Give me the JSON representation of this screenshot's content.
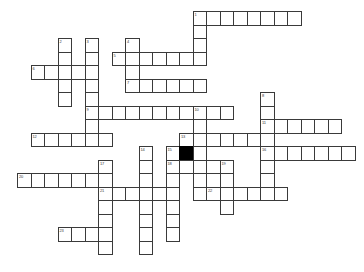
{
  "puzzle": {
    "title": "Crossword Puzzle Grid",
    "grid": {
      "cell_size": 13.5,
      "origin_x": 17,
      "origin_y": 11,
      "columns": 25,
      "rows": 19,
      "line_color": "#3a3a3a",
      "cell_color": "#ffffff",
      "block_color": "#000000",
      "background_color": "#ffffff"
    },
    "entries": [
      {
        "number": "1",
        "direction": "across",
        "row": 0,
        "col": 13,
        "length": 8
      },
      {
        "number": "1",
        "direction": "down",
        "row": 0,
        "col": 13,
        "length": 4
      },
      {
        "number": "2",
        "direction": "down",
        "row": 2,
        "col": 3,
        "length": 5
      },
      {
        "number": "3",
        "direction": "down",
        "row": 2,
        "col": 5,
        "length": 8
      },
      {
        "number": "4",
        "direction": "down",
        "row": 2,
        "col": 8,
        "length": 5
      },
      {
        "number": "5",
        "direction": "across",
        "row": 3,
        "col": 7,
        "length": 7
      },
      {
        "number": "6",
        "direction": "across",
        "row": 4,
        "col": 1,
        "length": 5
      },
      {
        "number": "7",
        "direction": "across",
        "row": 5,
        "col": 8,
        "length": 6
      },
      {
        "number": "8",
        "direction": "down",
        "row": 6,
        "col": 18,
        "length": 7
      },
      {
        "number": "9",
        "direction": "across",
        "row": 7,
        "col": 5,
        "length": 11
      },
      {
        "number": "10",
        "direction": "down",
        "row": 7,
        "col": 13,
        "length": 6
      },
      {
        "number": "11",
        "direction": "across",
        "row": 8,
        "col": 18,
        "length": 6
      },
      {
        "number": "12",
        "direction": "across",
        "row": 9,
        "col": 1,
        "length": 6
      },
      {
        "number": "13",
        "direction": "across",
        "row": 9,
        "col": 12,
        "length": 6
      },
      {
        "number": "14",
        "direction": "down",
        "row": 10,
        "col": 9,
        "length": 8
      },
      {
        "number": "15",
        "direction": "down",
        "row": 10,
        "col": 11,
        "length": 7
      },
      {
        "number": "16",
        "direction": "across",
        "row": 10,
        "col": 18,
        "length": 7
      },
      {
        "number": "17",
        "direction": "down",
        "row": 11,
        "col": 6,
        "length": 8
      },
      {
        "number": "18",
        "direction": "across",
        "row": 11,
        "col": 11,
        "length": 5
      },
      {
        "number": "19",
        "direction": "down",
        "row": 11,
        "col": 15,
        "length": 4
      },
      {
        "number": "20",
        "direction": "across",
        "row": 12,
        "col": 0,
        "length": 7
      },
      {
        "number": "21",
        "direction": "across",
        "row": 13,
        "col": 6,
        "length": 6
      },
      {
        "number": "22",
        "direction": "across",
        "row": 13,
        "col": 14,
        "length": 6
      },
      {
        "number": "23",
        "direction": "across",
        "row": 16,
        "col": 3,
        "length": 4
      }
    ],
    "cells": [
      {
        "col": 13,
        "row": 0,
        "number": "1"
      },
      {
        "col": 14,
        "row": 0
      },
      {
        "col": 15,
        "row": 0
      },
      {
        "col": 16,
        "row": 0
      },
      {
        "col": 17,
        "row": 0
      },
      {
        "col": 18,
        "row": 0
      },
      {
        "col": 19,
        "row": 0
      },
      {
        "col": 20,
        "row": 0
      },
      {
        "col": 13,
        "row": 1
      },
      {
        "col": 13,
        "row": 2
      },
      {
        "col": 3,
        "row": 2,
        "number": "2"
      },
      {
        "col": 5,
        "row": 2,
        "number": "3"
      },
      {
        "col": 8,
        "row": 2,
        "number": "4"
      },
      {
        "col": 7,
        "row": 3,
        "number": "5"
      },
      {
        "col": 8,
        "row": 3
      },
      {
        "col": 9,
        "row": 3
      },
      {
        "col": 10,
        "row": 3
      },
      {
        "col": 11,
        "row": 3
      },
      {
        "col": 12,
        "row": 3
      },
      {
        "col": 13,
        "row": 3
      },
      {
        "col": 3,
        "row": 3
      },
      {
        "col": 5,
        "row": 3
      },
      {
        "col": 1,
        "row": 4,
        "number": "6"
      },
      {
        "col": 2,
        "row": 4
      },
      {
        "col": 3,
        "row": 4
      },
      {
        "col": 4,
        "row": 4
      },
      {
        "col": 5,
        "row": 4
      },
      {
        "col": 8,
        "row": 4
      },
      {
        "col": 3,
        "row": 5
      },
      {
        "col": 5,
        "row": 5
      },
      {
        "col": 8,
        "row": 5,
        "number": "7"
      },
      {
        "col": 9,
        "row": 5
      },
      {
        "col": 10,
        "row": 5
      },
      {
        "col": 11,
        "row": 5
      },
      {
        "col": 12,
        "row": 5
      },
      {
        "col": 13,
        "row": 5
      },
      {
        "col": 3,
        "row": 6
      },
      {
        "col": 5,
        "row": 6
      },
      {
        "col": 18,
        "row": 6,
        "number": "8"
      },
      {
        "col": 5,
        "row": 7,
        "number": "9"
      },
      {
        "col": 6,
        "row": 7
      },
      {
        "col": 7,
        "row": 7
      },
      {
        "col": 8,
        "row": 7
      },
      {
        "col": 9,
        "row": 7
      },
      {
        "col": 10,
        "row": 7
      },
      {
        "col": 11,
        "row": 7
      },
      {
        "col": 12,
        "row": 7
      },
      {
        "col": 13,
        "row": 7,
        "number": "10"
      },
      {
        "col": 14,
        "row": 7
      },
      {
        "col": 15,
        "row": 7
      },
      {
        "col": 18,
        "row": 7
      },
      {
        "col": 5,
        "row": 8
      },
      {
        "col": 13,
        "row": 8
      },
      {
        "col": 18,
        "row": 8,
        "number": "11"
      },
      {
        "col": 19,
        "row": 8
      },
      {
        "col": 20,
        "row": 8
      },
      {
        "col": 21,
        "row": 8
      },
      {
        "col": 22,
        "row": 8
      },
      {
        "col": 23,
        "row": 8
      },
      {
        "col": 1,
        "row": 9,
        "number": "12"
      },
      {
        "col": 2,
        "row": 9
      },
      {
        "col": 3,
        "row": 9
      },
      {
        "col": 4,
        "row": 9
      },
      {
        "col": 5,
        "row": 9
      },
      {
        "col": 6,
        "row": 9
      },
      {
        "col": 12,
        "row": 9,
        "number": "13"
      },
      {
        "col": 13,
        "row": 9
      },
      {
        "col": 14,
        "row": 9
      },
      {
        "col": 15,
        "row": 9
      },
      {
        "col": 16,
        "row": 9
      },
      {
        "col": 17,
        "row": 9
      },
      {
        "col": 18,
        "row": 9
      },
      {
        "col": 9,
        "row": 10,
        "number": "14"
      },
      {
        "col": 11,
        "row": 10,
        "number": "15"
      },
      {
        "col": 12,
        "row": 10,
        "block": true
      },
      {
        "col": 13,
        "row": 10
      },
      {
        "col": 18,
        "row": 10,
        "number": "16"
      },
      {
        "col": 19,
        "row": 10
      },
      {
        "col": 20,
        "row": 10
      },
      {
        "col": 21,
        "row": 10
      },
      {
        "col": 22,
        "row": 10
      },
      {
        "col": 23,
        "row": 10
      },
      {
        "col": 24,
        "row": 10
      },
      {
        "col": 6,
        "row": 11,
        "number": "17"
      },
      {
        "col": 9,
        "row": 11
      },
      {
        "col": 11,
        "row": 11,
        "number": "18"
      },
      {
        "col": 12,
        "row": 11
      },
      {
        "col": 13,
        "row": 11
      },
      {
        "col": 14,
        "row": 11
      },
      {
        "col": 15,
        "row": 11,
        "number": "19"
      },
      {
        "col": 18,
        "row": 11
      },
      {
        "col": 0,
        "row": 12,
        "number": "20"
      },
      {
        "col": 1,
        "row": 12
      },
      {
        "col": 2,
        "row": 12
      },
      {
        "col": 3,
        "row": 12
      },
      {
        "col": 4,
        "row": 12
      },
      {
        "col": 5,
        "row": 12
      },
      {
        "col": 6,
        "row": 12
      },
      {
        "col": 9,
        "row": 12
      },
      {
        "col": 11,
        "row": 12
      },
      {
        "col": 13,
        "row": 12
      },
      {
        "col": 15,
        "row": 12
      },
      {
        "col": 18,
        "row": 12
      },
      {
        "col": 6,
        "row": 13,
        "number": "21"
      },
      {
        "col": 7,
        "row": 13
      },
      {
        "col": 8,
        "row": 13
      },
      {
        "col": 9,
        "row": 13
      },
      {
        "col": 10,
        "row": 13
      },
      {
        "col": 11,
        "row": 13
      },
      {
        "col": 13,
        "row": 13
      },
      {
        "col": 14,
        "row": 13,
        "number": "22"
      },
      {
        "col": 15,
        "row": 13
      },
      {
        "col": 16,
        "row": 13
      },
      {
        "col": 17,
        "row": 13
      },
      {
        "col": 18,
        "row": 13
      },
      {
        "col": 19,
        "row": 13
      },
      {
        "col": 6,
        "row": 14
      },
      {
        "col": 9,
        "row": 14
      },
      {
        "col": 11,
        "row": 14
      },
      {
        "col": 15,
        "row": 14
      },
      {
        "col": 6,
        "row": 15
      },
      {
        "col": 9,
        "row": 15
      },
      {
        "col": 11,
        "row": 15
      },
      {
        "col": 3,
        "row": 16,
        "number": "23"
      },
      {
        "col": 4,
        "row": 16
      },
      {
        "col": 5,
        "row": 16
      },
      {
        "col": 6,
        "row": 16
      },
      {
        "col": 9,
        "row": 16
      },
      {
        "col": 11,
        "row": 16
      },
      {
        "col": 6,
        "row": 17
      },
      {
        "col": 9,
        "row": 17
      }
    ]
  }
}
